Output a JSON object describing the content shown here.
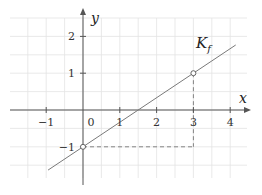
{
  "chart_data": {
    "type": "line",
    "title": "",
    "xlabel": "x",
    "ylabel": "y",
    "xlim": [
      -1.95,
      4.45
    ],
    "ylim": [
      -1.85,
      2.5
    ],
    "grid": true,
    "grid_step": 0.5,
    "x_ticks": [
      -1,
      0,
      1,
      2,
      3,
      4
    ],
    "x_tick_labels": [
      "−1",
      "0",
      "1",
      "2",
      "3",
      "4"
    ],
    "y_ticks": [
      -1,
      1,
      2
    ],
    "y_tick_labels": [
      "−1",
      "1",
      "2"
    ],
    "series": [
      {
        "name": "K_f",
        "label_main": "K",
        "label_sub": "f",
        "slope": 0.6667,
        "intercept": -1,
        "x": [
          -0.95,
          4.15
        ],
        "y": [
          -1.633,
          1.767
        ]
      }
    ],
    "highlighted_points": [
      {
        "x": 0,
        "y": -1
      },
      {
        "x": 3,
        "y": 1
      }
    ],
    "guide_lines": [
      {
        "from": [
          3,
          1
        ],
        "to": [
          3,
          -1
        ],
        "style": "dashed"
      },
      {
        "from": [
          0,
          -1
        ],
        "to": [
          3,
          -1
        ],
        "style": "dashed"
      }
    ],
    "colors": {
      "grid": "#e3e3e3",
      "axis": "#555555",
      "line": "#7a7a7a",
      "guide": "#777777"
    }
  }
}
